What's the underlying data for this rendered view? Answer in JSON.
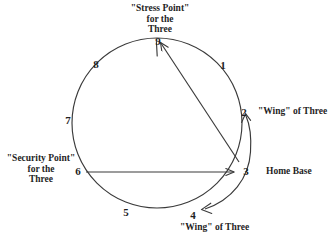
{
  "diagram": {
    "stroke_color": "#3a3a3a",
    "background_color": "#ffffff",
    "text_color": "#1f1f1f",
    "points": [
      {
        "id": "1",
        "label": "1"
      },
      {
        "id": "2",
        "label": "2"
      },
      {
        "id": "3",
        "label": "3"
      },
      {
        "id": "4",
        "label": "4"
      },
      {
        "id": "5",
        "label": "5"
      },
      {
        "id": "6",
        "label": "6"
      },
      {
        "id": "7",
        "label": "7"
      },
      {
        "id": "8",
        "label": "8"
      },
      {
        "id": "9",
        "label": "9"
      }
    ],
    "captions": {
      "stress_point": "\"Stress Point\"\nfor the\nThree",
      "security_point": "\"Security Point\"\nfor the\nThree",
      "wing_right": "\"Wing\" of Three",
      "wing_bottom": "\"Wing\" of Three",
      "home_base": "Home Base"
    }
  }
}
